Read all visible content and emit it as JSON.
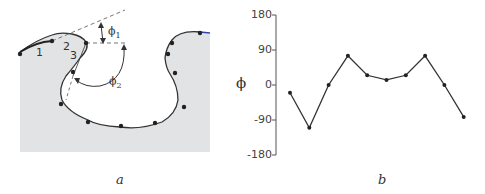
{
  "panel_a": {
    "caption": "a",
    "segment_labels": [
      "1",
      "2",
      "3"
    ],
    "angle_labels": [
      {
        "symbol": "ϕ",
        "sub": "1"
      },
      {
        "symbol": "ϕ",
        "sub": "2"
      }
    ],
    "colors": {
      "fill": "#e2e3e5",
      "curve": "#333333",
      "dashed": "#777777",
      "accent": "#3344aa"
    }
  },
  "panel_b": {
    "caption": "b",
    "ylabel": "ϕ",
    "yticks": [
      "180",
      "90",
      "0",
      "-90",
      "-180"
    ]
  },
  "chart_data": {
    "type": "line",
    "title": "",
    "xlabel": "",
    "ylabel": "ϕ",
    "ylim": [
      -180,
      180
    ],
    "yticks": [
      180,
      90,
      0,
      -90,
      -180
    ],
    "grid": false,
    "x": [
      1,
      2,
      3,
      4,
      5,
      6,
      7,
      8,
      9,
      10
    ],
    "values": [
      -20,
      -110,
      0,
      75,
      25,
      13,
      25,
      75,
      0,
      -82
    ]
  }
}
